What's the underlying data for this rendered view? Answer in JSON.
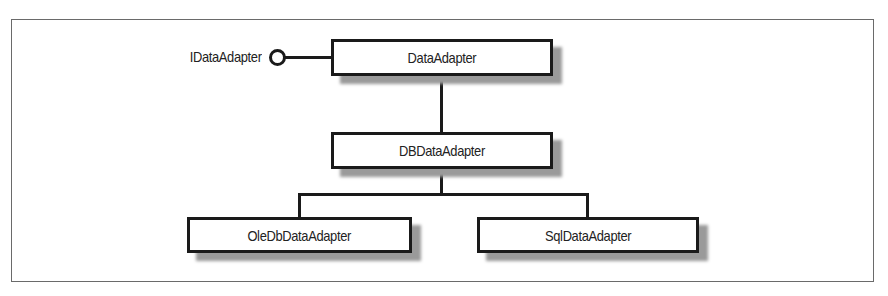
{
  "diagram": {
    "type": "uml-class-hierarchy",
    "interface": {
      "label": "IDataAdapter",
      "icon": "lollipop-interface-icon"
    },
    "classes": {
      "root": "DataAdapter",
      "middle": "DBDataAdapter",
      "children": [
        "OleDbDataAdapter",
        "SqlDataAdapter"
      ]
    },
    "relations": [
      {
        "from": "DataAdapter",
        "to": "IDataAdapter",
        "kind": "implements"
      },
      {
        "from": "DBDataAdapter",
        "to": "DataAdapter",
        "kind": "inherits"
      },
      {
        "from": "OleDbDataAdapter",
        "to": "DBDataAdapter",
        "kind": "inherits"
      },
      {
        "from": "SqlDataAdapter",
        "to": "DBDataAdapter",
        "kind": "inherits"
      }
    ],
    "colors": {
      "stroke": "#1a1a1a",
      "shadow": "#9a9a9a",
      "frame": "#6a6a6a",
      "background": "#ffffff"
    }
  }
}
